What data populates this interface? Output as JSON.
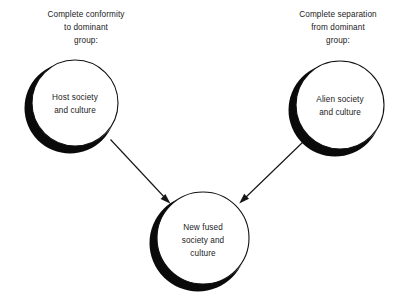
{
  "diagram": {
    "type": "assimilation-model-diagram",
    "background_color": "#ffffff",
    "ink_color": "#111111",
    "shadow_color": "#0a0a0a",
    "captions": {
      "left": {
        "line1": "Complete conformity",
        "line2": "to dominant",
        "line3": "group:"
      },
      "right": {
        "line1": "Complete separation",
        "line2": "from dominant",
        "line3": "group:"
      }
    },
    "nodes": {
      "host": {
        "line1": "Host society",
        "line2": "and culture",
        "cx": 75,
        "cy": 103,
        "r": 43
      },
      "alien": {
        "line1": "Alien society",
        "line2": "and culture",
        "cx": 340,
        "cy": 105,
        "r": 44
      },
      "fused": {
        "line1": "New fused",
        "line2": "society and",
        "line3": "culture",
        "cx": 203,
        "cy": 238,
        "r": 46
      }
    },
    "arrows": {
      "left_to_center": {
        "from": "host",
        "to": "fused",
        "label": ""
      },
      "right_to_center": {
        "from": "alien",
        "to": "fused",
        "label": ""
      }
    }
  }
}
